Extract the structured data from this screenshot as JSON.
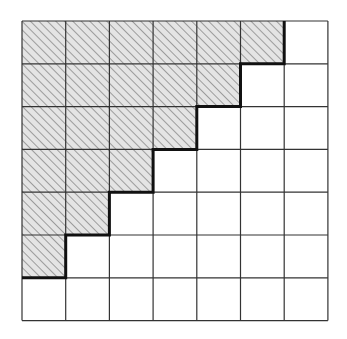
{
  "diagram": {
    "type": "staircase-grid",
    "rows": 7,
    "cols": 7,
    "hatched_cells_per_row": [
      6,
      5,
      4,
      3,
      2,
      1,
      0
    ],
    "grid": {
      "left": 22,
      "top": 21,
      "cell_w": 43.7,
      "cell_h": 42.8
    },
    "colors": {
      "background": "#ffffff",
      "grid_line": "#333333",
      "hatch_fill": "#e4e4e4",
      "hatch_line": "#555555",
      "boundary": "#111111"
    },
    "boundary_description": "Thick staircase path separating hatched region (upper-left) from unhatched region (lower-right)"
  }
}
